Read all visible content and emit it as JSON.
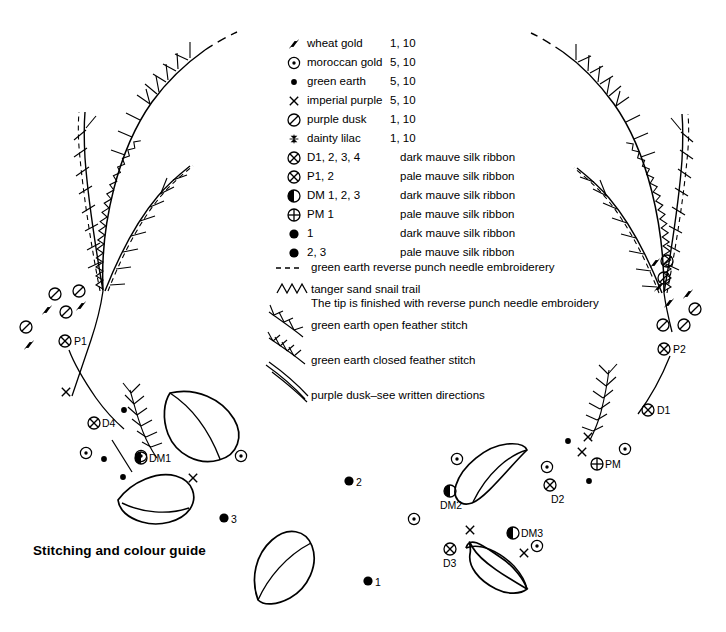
{
  "title": "Stitching and colour guide",
  "legend": {
    "rows": [
      {
        "symbol": "wheat-gold-icon",
        "name": "wheat gold",
        "value": "1, 10",
        "desc": ""
      },
      {
        "symbol": "moroccan-gold-icon",
        "name": "moroccan gold",
        "value": "5, 10",
        "desc": ""
      },
      {
        "symbol": "green-earth-icon",
        "name": "green earth",
        "value": "5, 10",
        "desc": ""
      },
      {
        "symbol": "imperial-purple-icon",
        "name": "imperial purple",
        "value": "5, 10",
        "desc": ""
      },
      {
        "symbol": "purple-dusk-icon",
        "name": "purple dusk",
        "value": "1, 10",
        "desc": ""
      },
      {
        "symbol": "dainty-lilac-icon",
        "name": "dainty lilac",
        "value": "1, 10",
        "desc": ""
      },
      {
        "symbol": "circle-x-icon",
        "name": "D1, 2, 3, 4",
        "value": "",
        "desc": "dark mauve silk ribbon"
      },
      {
        "symbol": "circle-x-icon",
        "name": "P1, 2",
        "value": "",
        "desc": "pale mauve silk ribbon"
      },
      {
        "symbol": "circle-half-icon",
        "name": "DM 1, 2, 3",
        "value": "",
        "desc": "dark mauve silk ribbon"
      },
      {
        "symbol": "circle-plus-icon",
        "name": "PM 1",
        "value": "",
        "desc": "pale mauve silk ribbon"
      },
      {
        "symbol": "filled-dot-icon",
        "name": "1",
        "value": "",
        "desc": "dark mauve silk ribbon"
      },
      {
        "symbol": "filled-dot-icon",
        "name": "2, 3",
        "value": "",
        "desc": "pale mauve silk ribbon"
      }
    ],
    "stitch_rows": [
      {
        "symbol": "dashed-line-icon",
        "text": "green earth reverse punch needle embroiderery"
      },
      {
        "symbol": "zigzag-icon",
        "text": "tanger sand snail trail"
      },
      {
        "symbol": "",
        "text": "The tip is finished with reverse punch needle embroidery"
      },
      {
        "symbol": "open-feather-stitch-icon",
        "text": "green earth open feather stitch"
      },
      {
        "symbol": "closed-feather-stitch-icon",
        "text": "green earth closed feather stitch"
      },
      {
        "symbol": "curved-lines-icon",
        "text": "purple dusk–see written directions"
      }
    ]
  },
  "markers": [
    {
      "label": "P1",
      "x": 76,
      "y": 341
    },
    {
      "label": "D4",
      "x": 103,
      "y": 423
    },
    {
      "label": "DM1",
      "x": 148,
      "y": 458
    },
    {
      "label": "P2",
      "x": 673,
      "y": 349
    },
    {
      "label": "D1",
      "x": 657,
      "y": 410
    },
    {
      "label": "PM",
      "x": 604,
      "y": 464
    },
    {
      "label": "DM2",
      "x": 445,
      "y": 500
    },
    {
      "label": "D2",
      "x": 557,
      "y": 495
    },
    {
      "label": "DM3",
      "x": 520,
      "y": 533
    },
    {
      "label": "D3",
      "x": 447,
      "y": 559
    },
    {
      "label": "1",
      "x": 377,
      "y": 581
    },
    {
      "label": "2",
      "x": 357,
      "y": 482
    },
    {
      "label": "3",
      "x": 231,
      "y": 518
    }
  ],
  "colors": {
    "ink": "#000000",
    "background": "#ffffff"
  }
}
